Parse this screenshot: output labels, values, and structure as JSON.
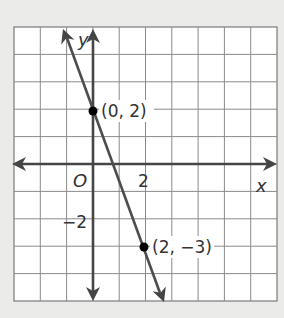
{
  "chart_data": {
    "type": "line",
    "title": "",
    "xlabel": "x",
    "ylabel": "y",
    "xlim": [
      -3,
      7
    ],
    "ylim": [
      -5,
      5
    ],
    "grid": true,
    "grid_step": 1,
    "origin_label": "O",
    "x_tick_labels": [
      {
        "value": 2,
        "label": "2"
      }
    ],
    "y_tick_labels": [
      {
        "value": -2,
        "label": "−2"
      }
    ],
    "series": [
      {
        "name": "line",
        "equation": "y = -2.5x + 2",
        "slope": -2.5,
        "intercept": 2,
        "x": [
          -0.8,
          2.8
        ],
        "y": [
          4.0,
          -5.0
        ],
        "arrows_both_ends": true
      }
    ],
    "points": [
      {
        "x": 0,
        "y": 2,
        "label": "(0, 2)"
      },
      {
        "x": 2,
        "y": -3,
        "label": "(2, −3)"
      }
    ],
    "colors": {
      "background": "#ebebea",
      "grid": "#8a8a8a",
      "axes": "#454545",
      "line": "#4d4d4d",
      "point": "#000000",
      "text": "#333333"
    }
  }
}
